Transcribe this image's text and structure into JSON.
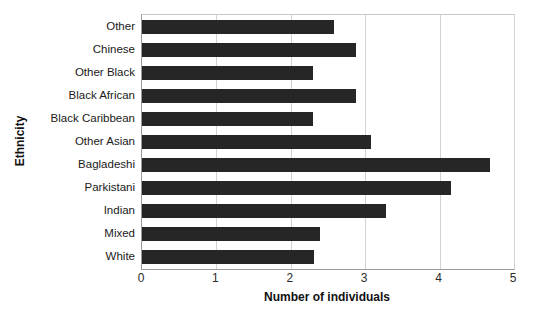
{
  "chart_data": {
    "type": "bar",
    "orientation": "horizontal",
    "title": "",
    "xlabel": "Number of individuals",
    "ylabel": "Ethnicity",
    "categories": [
      "White",
      "Mixed",
      "Indian",
      "Parkistani",
      "Bagladeshi",
      "Other Asian",
      "Black Caribbean",
      "Black African",
      "Other Black",
      "Chinese",
      "Other"
    ],
    "values": [
      2.31,
      2.39,
      3.28,
      4.15,
      4.68,
      3.08,
      2.3,
      2.88,
      2.3,
      2.88,
      2.58
    ],
    "xlim": [
      0,
      5
    ],
    "xticks": [
      0,
      1,
      2,
      3,
      4,
      5
    ],
    "xtick_labels": [
      "0",
      "1",
      "2",
      "3",
      "4",
      "5"
    ],
    "grid": "vertical",
    "legend": "none",
    "bar_color": "#262626",
    "gridline_color": "#d2d2d2",
    "axis_color": "#9a9a9a",
    "background": "#ffffff"
  }
}
